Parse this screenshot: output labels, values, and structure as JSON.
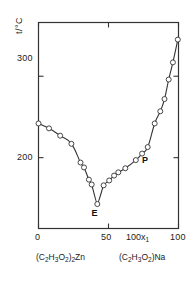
{
  "figure": {
    "background": "#ffffff",
    "line_color": "#333333",
    "marker_fill": "#ffffff",
    "marker_stroke": "#333333"
  },
  "axes": {
    "y_title": "t/°C",
    "y_ticks": [
      {
        "value": 200,
        "label": "200"
      },
      {
        "value": 300,
        "label": "300"
      }
    ],
    "x_title": "100x",
    "x_title_sub": "1",
    "x_ticks": [
      {
        "value": 0,
        "label": "0"
      },
      {
        "value": 50,
        "label": "50"
      },
      {
        "value": 100,
        "label": "100"
      }
    ],
    "x_range": [
      0,
      100
    ],
    "y_range": [
      113,
      366
    ]
  },
  "endpoint_labels": {
    "left": {
      "text": "(C2H3O2)2Zn",
      "parts": [
        "(C",
        "2",
        "H",
        "3",
        "O",
        "2",
        ")",
        "2",
        "Zn"
      ]
    },
    "right": {
      "text": "(C2H3O2)Na",
      "parts": [
        "(C",
        "2",
        "H",
        "3",
        "O",
        "2",
        ")",
        "Na"
      ]
    }
  },
  "annotations": [
    {
      "name": "eutectic-label",
      "text": "E",
      "x": 40.0,
      "y": 131
    },
    {
      "name": "peritectic-label",
      "text": "P",
      "x": 76.0,
      "y": 196
    }
  ],
  "chart_data": {
    "type": "scatter",
    "title": "",
    "xlabel": "100x1",
    "ylabel": "t/°C",
    "xlim": [
      0,
      100
    ],
    "ylim": [
      113,
      366
    ],
    "grid": false,
    "legend": false,
    "series": [
      {
        "name": "liquidus",
        "marker": "open-circle",
        "line": true,
        "points": [
          {
            "x": 0.0,
            "y": 242
          },
          {
            "x": 7.5,
            "y": 236
          },
          {
            "x": 15.5,
            "y": 227
          },
          {
            "x": 23.5,
            "y": 217
          },
          {
            "x": 30.0,
            "y": 194
          },
          {
            "x": 32.5,
            "y": 188
          },
          {
            "x": 36.0,
            "y": 173
          },
          {
            "x": 38.0,
            "y": 167
          },
          {
            "x": 42.0,
            "y": 143
          },
          {
            "x": 46.5,
            "y": 166
          },
          {
            "x": 50.5,
            "y": 172
          },
          {
            "x": 54.0,
            "y": 178
          },
          {
            "x": 57.0,
            "y": 182
          },
          {
            "x": 62.0,
            "y": 187
          },
          {
            "x": 69.5,
            "y": 197
          },
          {
            "x": 74.0,
            "y": 205
          },
          {
            "x": 78.0,
            "y": 213
          },
          {
            "x": 83.0,
            "y": 242
          },
          {
            "x": 87.0,
            "y": 257
          },
          {
            "x": 90.0,
            "y": 272
          },
          {
            "x": 93.0,
            "y": 296
          },
          {
            "x": 96.0,
            "y": 317
          },
          {
            "x": 99.5,
            "y": 345
          }
        ]
      }
    ]
  }
}
